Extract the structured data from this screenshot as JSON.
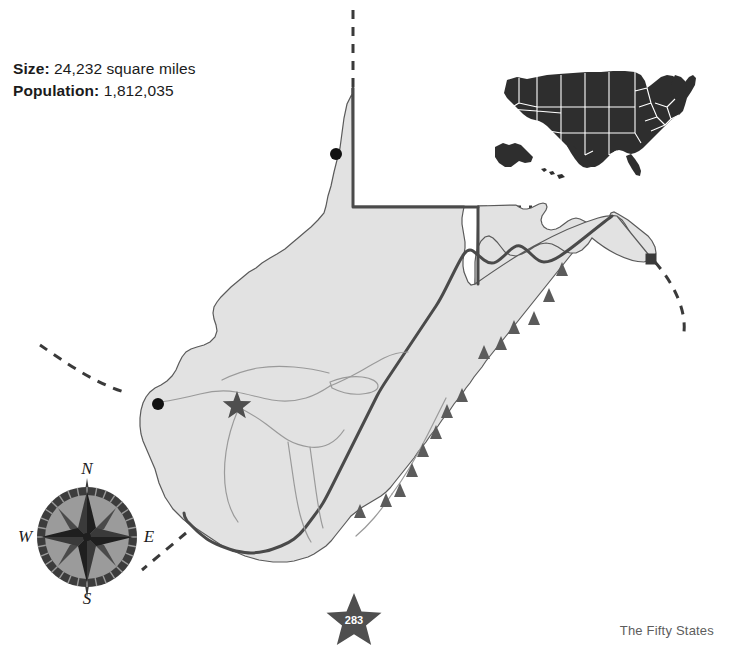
{
  "page": {
    "caption": "The Fifty States",
    "page_number": "283",
    "background_color": "#ffffff"
  },
  "stats": {
    "size_label": "Size:",
    "size_value": "24,232 square miles",
    "population_label": "Population:",
    "population_value": "1,812,035"
  },
  "compass": {
    "north": "N",
    "east": "E",
    "south": "S",
    "west": "W"
  },
  "colors": {
    "state_fill": "#e2e2e2",
    "state_border": "#4a4a4a",
    "marker_gray": "#5b5b5b",
    "marker_black": "#111111",
    "river": "#9a9a9a",
    "inset_fill": "#2e2e2e",
    "inset_border": "#ffffff",
    "text": "#1b1b1b",
    "caption_text": "#5d5d5d"
  },
  "map": {
    "title": "West Virginia state map",
    "legend_symbols": [
      {
        "symbol": "star",
        "meaning": "capital city"
      },
      {
        "symbol": "circle",
        "meaning": "city"
      },
      {
        "symbol": "triangle",
        "meaning": "mountain"
      },
      {
        "symbol": "square",
        "meaning": "point of interest"
      },
      {
        "symbol": "dashed-line",
        "meaning": "state boundary extension"
      }
    ],
    "city_dots": [
      {
        "name": "northern-panhandle-city",
        "x": 336,
        "y": 154
      },
      {
        "name": "western-border-city",
        "x": 158,
        "y": 404
      }
    ],
    "capital_star": {
      "name": "capital-city",
      "x": 237,
      "y": 406
    },
    "square_marker": {
      "name": "eastern-panhandle-marker",
      "x": 651,
      "y": 259
    },
    "mountain_triangles": [
      {
        "x": 562,
        "y": 269
      },
      {
        "x": 549,
        "y": 295
      },
      {
        "x": 534,
        "y": 318
      },
      {
        "x": 514,
        "y": 327
      },
      {
        "x": 501,
        "y": 343
      },
      {
        "x": 484,
        "y": 352
      },
      {
        "x": 462,
        "y": 395
      },
      {
        "x": 447,
        "y": 411
      },
      {
        "x": 436,
        "y": 432
      },
      {
        "x": 423,
        "y": 450
      },
      {
        "x": 412,
        "y": 470
      },
      {
        "x": 400,
        "y": 490
      },
      {
        "x": 386,
        "y": 500
      },
      {
        "x": 360,
        "y": 511
      }
    ]
  },
  "us_inset": {
    "label": "United States locator map",
    "includes_alaska": true,
    "includes_hawaii": true
  }
}
